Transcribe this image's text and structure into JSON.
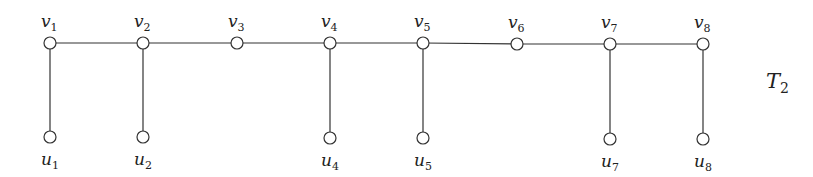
{
  "diagram": {
    "title": {
      "main": "T",
      "sub": "2",
      "x": 766,
      "y": 88
    },
    "colors": {
      "stroke": "#333333",
      "node_fill": "#ffffff",
      "text": "#222222"
    },
    "node_radius": 6,
    "top_nodes": [
      {
        "id": "v1",
        "name": "v",
        "sub": "1",
        "x": 50,
        "y": 43
      },
      {
        "id": "v2",
        "name": "v",
        "sub": "2",
        "x": 143,
        "y": 43
      },
      {
        "id": "v3",
        "name": "v",
        "sub": "3",
        "x": 237,
        "y": 43
      },
      {
        "id": "v4",
        "name": "v",
        "sub": "4",
        "x": 330,
        "y": 43
      },
      {
        "id": "v5",
        "name": "v",
        "sub": "5",
        "x": 423,
        "y": 43
      },
      {
        "id": "v6",
        "name": "v",
        "sub": "6",
        "x": 517,
        "y": 44
      },
      {
        "id": "v7",
        "name": "v",
        "sub": "7",
        "x": 610,
        "y": 44
      },
      {
        "id": "v8",
        "name": "v",
        "sub": "8",
        "x": 703,
        "y": 44
      }
    ],
    "bottom_nodes": [
      {
        "id": "u1",
        "name": "u",
        "sub": "1",
        "x": 50,
        "y": 137,
        "parent": "v1"
      },
      {
        "id": "u2",
        "name": "u",
        "sub": "2",
        "x": 143,
        "y": 137,
        "parent": "v2"
      },
      {
        "id": "u4",
        "name": "u",
        "sub": "4",
        "x": 330,
        "y": 138,
        "parent": "v4"
      },
      {
        "id": "u5",
        "name": "u",
        "sub": "5",
        "x": 423,
        "y": 138,
        "parent": "v5"
      },
      {
        "id": "u7",
        "name": "u",
        "sub": "7",
        "x": 610,
        "y": 139,
        "parent": "v7"
      },
      {
        "id": "u8",
        "name": "u",
        "sub": "8",
        "x": 703,
        "y": 139,
        "parent": "v8"
      }
    ],
    "edges": [
      [
        "v1",
        "v2"
      ],
      [
        "v2",
        "v3"
      ],
      [
        "v3",
        "v4"
      ],
      [
        "v4",
        "v5"
      ],
      [
        "v5",
        "v6"
      ],
      [
        "v6",
        "v7"
      ],
      [
        "v7",
        "v8"
      ],
      [
        "v1",
        "u1"
      ],
      [
        "v2",
        "u2"
      ],
      [
        "v4",
        "u4"
      ],
      [
        "v5",
        "u5"
      ],
      [
        "v7",
        "u7"
      ],
      [
        "v8",
        "u8"
      ]
    ]
  }
}
